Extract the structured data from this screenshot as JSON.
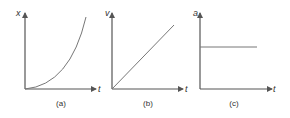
{
  "figure": {
    "panels": [
      {
        "id": "a",
        "caption": "(a)",
        "y_label": "x",
        "x_label": "t",
        "curve": "parabola",
        "description": "position increases quadratically with time"
      },
      {
        "id": "b",
        "caption": "(b)",
        "y_label": "v",
        "x_label": "t",
        "curve": "linear",
        "description": "velocity increases linearly with time"
      },
      {
        "id": "c",
        "caption": "(c)",
        "y_label": "a",
        "x_label": "t",
        "curve": "constant",
        "description": "acceleration is constant"
      }
    ],
    "colors": {
      "axis": "#555555",
      "curve": "#777777",
      "text": "#333333"
    }
  }
}
